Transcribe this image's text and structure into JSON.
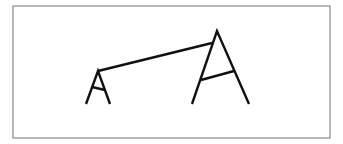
{
  "figure": {
    "border": {
      "x": 13,
      "y": 6,
      "width": 317,
      "height": 132,
      "color": "#8a8a8a"
    },
    "stroke_color": "#111111",
    "small_frame": {
      "apex": [
        98,
        71
      ],
      "left_foot": [
        86,
        104
      ],
      "right_foot": [
        110,
        104
      ],
      "crossbar": [
        [
          92,
          87
        ],
        [
          105,
          90
        ]
      ]
    },
    "large_frame": {
      "apex": [
        217,
        31
      ],
      "left_foot": [
        192,
        104
      ],
      "right_foot": [
        249,
        104
      ],
      "crossbar": [
        [
          201,
          80
        ],
        [
          234,
          71
        ]
      ]
    },
    "connector": {
      "from": [
        98,
        71
      ],
      "to": [
        212,
        43
      ]
    }
  }
}
